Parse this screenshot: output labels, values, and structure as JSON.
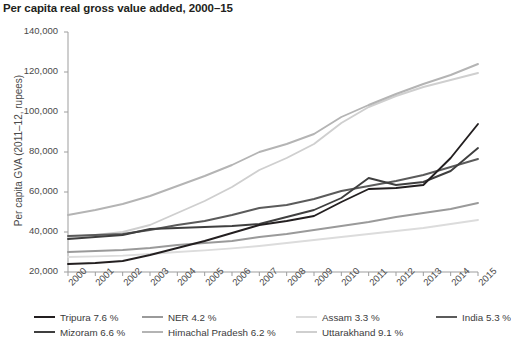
{
  "header": {
    "title": "Per capita real gross value added, 2000–15"
  },
  "axes": {
    "y_title": "Per capita GVA (2011–12, rupees)",
    "y_ticks": [
      "20,000",
      "40,000",
      "60,000",
      "80,000",
      "100,000",
      "120,000",
      "140,000"
    ],
    "x_ticks": [
      "2000",
      "2001",
      "2002",
      "2003",
      "2004",
      "2005",
      "2006",
      "2007",
      "2008",
      "2009",
      "2010",
      "2011",
      "2012",
      "2013",
      "2014",
      "2015"
    ]
  },
  "legend": {
    "items": [
      {
        "label": "Tripura 7.6 %",
        "color": "#231f20",
        "row": 1,
        "col": 1
      },
      {
        "label": "NER 4.2 %",
        "color": "#9a9a9a",
        "row": 1,
        "col": 2
      },
      {
        "label": "Assam 3.3 %",
        "color": "#dcdcdc",
        "row": 1,
        "col": 3
      },
      {
        "label": "India 5.3 %",
        "color": "#5b5b5b",
        "row": 1,
        "col": 4
      },
      {
        "label": "Mizoram 6.6 %",
        "color": "#3f3f3f",
        "row": 2,
        "col": 1
      },
      {
        "label": "Himachal Pradesh 6.2 %",
        "color": "#b4b4b4",
        "row": 2,
        "col": 2
      },
      {
        "label": "Uttarakhand 9.1 %",
        "color": "#cfcfcf",
        "row": 2,
        "col": 3
      }
    ]
  },
  "chart_data": {
    "type": "line",
    "title": "Per capita real gross value added, 2000–15",
    "xlabel": "",
    "ylabel": "Per capita GVA (2011–12, rupees)",
    "x": [
      2000,
      2001,
      2002,
      2003,
      2004,
      2005,
      2006,
      2007,
      2008,
      2009,
      2010,
      2011,
      2012,
      2013,
      2014,
      2015
    ],
    "ylim": [
      20000,
      140000
    ],
    "xlim": [
      2000,
      2015
    ],
    "grid": false,
    "legend_position": "bottom",
    "series": [
      {
        "name": "Tripura",
        "cagr_label": "7.6 %",
        "color": "#231f20",
        "values": [
          24000,
          24500,
          25500,
          28500,
          32000,
          35500,
          39500,
          43500,
          45500,
          48000,
          55000,
          61500,
          62000,
          63500,
          77000,
          94000
        ]
      },
      {
        "name": "Mizoram",
        "cagr_label": "6.6 %",
        "color": "#3f3f3f",
        "values": [
          36500,
          37500,
          38500,
          41500,
          42000,
          42500,
          43000,
          44000,
          47500,
          51000,
          57000,
          67000,
          63500,
          65000,
          70500,
          82000
        ]
      },
      {
        "name": "NER",
        "cagr_label": "4.2 %",
        "color": "#9a9a9a",
        "values": [
          30000,
          30500,
          31000,
          32000,
          33500,
          34500,
          35500,
          37500,
          39000,
          41000,
          43000,
          45000,
          47500,
          49500,
          51500,
          54500
        ]
      },
      {
        "name": "Himachal Pradesh",
        "cagr_label": "6.2 %",
        "color": "#b4b4b4",
        "values": [
          48500,
          51000,
          54000,
          58000,
          63000,
          68000,
          73500,
          80000,
          84000,
          89000,
          97500,
          103500,
          109000,
          114000,
          118500,
          124000
        ]
      },
      {
        "name": "Assam",
        "cagr_label": "3.3 %",
        "color": "#dcdcdc",
        "values": [
          27500,
          27800,
          28200,
          29000,
          30000,
          30800,
          31800,
          33000,
          34500,
          36000,
          37500,
          39000,
          40500,
          42000,
          44000,
          46000
        ]
      },
      {
        "name": "Uttarakhand",
        "cagr_label": "9.1 %",
        "color": "#cfcfcf",
        "values": [
          37500,
          38500,
          40000,
          43500,
          49500,
          55500,
          62500,
          71000,
          77000,
          84000,
          94500,
          102500,
          108000,
          112500,
          116000,
          119500
        ]
      },
      {
        "name": "India",
        "cagr_label": "5.3 %",
        "color": "#5b5b5b",
        "values": [
          38000,
          38500,
          39000,
          41000,
          43500,
          45500,
          48500,
          52000,
          53500,
          56500,
          60500,
          63000,
          65500,
          68500,
          72500,
          76500
        ]
      }
    ]
  }
}
